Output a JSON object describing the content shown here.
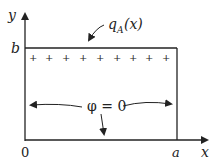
{
  "diagram": {
    "axes": {
      "x_label": "x",
      "y_label": "y",
      "origin_label": "0",
      "x_tick_label": "a",
      "y_tick_label": "b"
    },
    "top_boundary": {
      "label_main": "q",
      "label_sub": "A",
      "label_arg": "(x)",
      "charge_marks": [
        "+",
        "+",
        "+",
        "+",
        "+",
        "+",
        "+",
        "+",
        "+",
        "+",
        "+",
        "+"
      ]
    },
    "condition_label": "φ = 0",
    "colors": {
      "stroke": "#222222",
      "background": "#ffffff"
    }
  }
}
